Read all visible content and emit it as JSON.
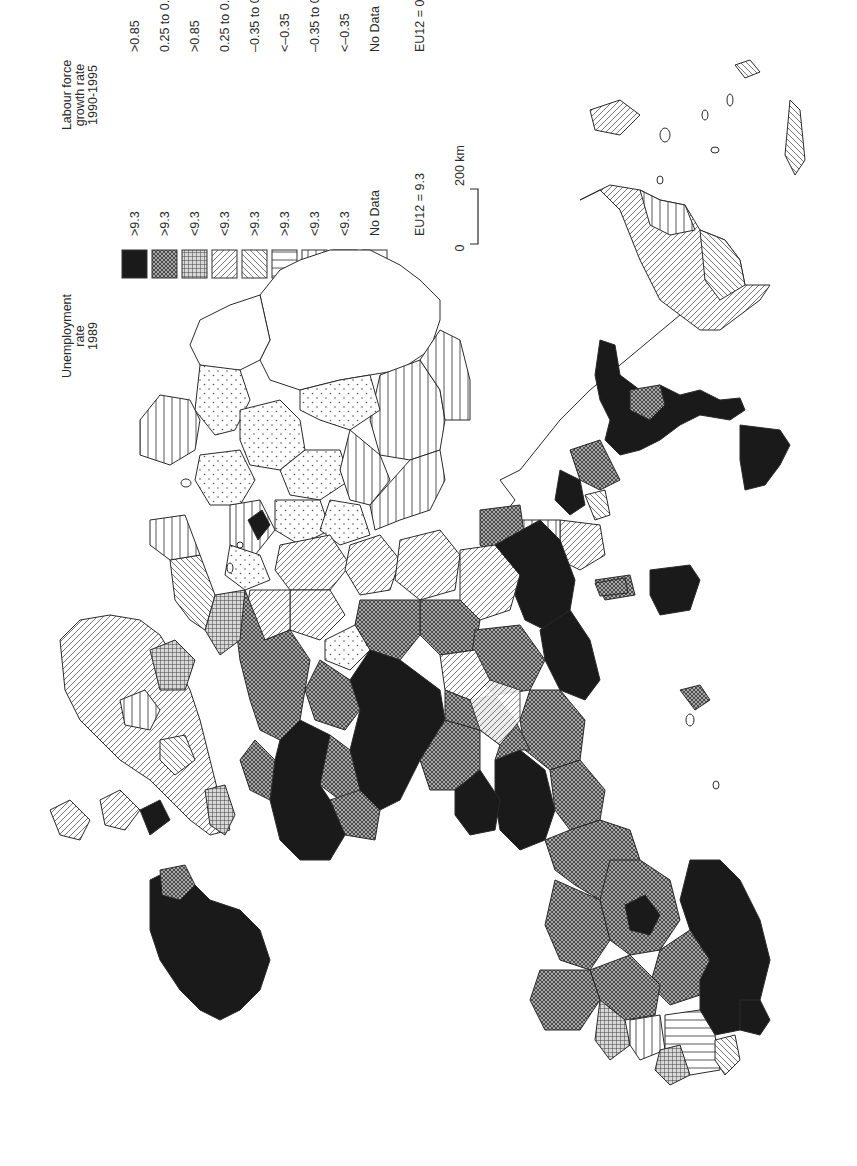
{
  "figure": {
    "type": "choropleth map (rotated 90° counter-clockwise)",
    "legend": {
      "header_unemployment": [
        "Unemployment",
        "rate",
        "1989"
      ],
      "header_labour": [
        "Labour force",
        "growth rate",
        "1990-1995"
      ],
      "rows": [
        {
          "pattern": "solid-black",
          "unemployment": ">9.3",
          "labour": ">0.85"
        },
        {
          "pattern": "fine-crosshatch",
          "unemployment": ">9.3",
          "labour": "0.25 to 0.85"
        },
        {
          "pattern": "grid",
          "unemployment": "<9.3",
          "labour": ">0.85"
        },
        {
          "pattern": "diagonal-forward",
          "unemployment": "<9.3",
          "labour": "0.25 to 0.85"
        },
        {
          "pattern": "diagonal-back",
          "unemployment": ">9.3",
          "labour": "–0.35 to 0.25"
        },
        {
          "pattern": "horizontal-lines",
          "unemployment": ">9.3",
          "labour": "<–0.35"
        },
        {
          "pattern": "vertical-lines",
          "unemployment": "<9.3",
          "labour": "–0.35 to 0.25"
        },
        {
          "pattern": "dots",
          "unemployment": "<9.3",
          "labour": "<–0.35"
        },
        {
          "pattern": "empty",
          "unemployment": "No Data",
          "labour": "No Data"
        }
      ],
      "eu12_unemployment": "EU12 = 9.3",
      "eu12_labour": "EU12 = 0.25"
    },
    "scale_bar": {
      "start": "0",
      "end": "200 km"
    },
    "colors": {
      "ink": "#1a1a1a",
      "background": "#ffffff",
      "line": "#2a2a2a"
    }
  }
}
